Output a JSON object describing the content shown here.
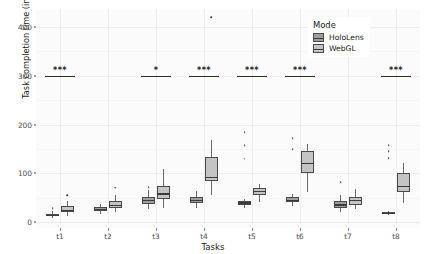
{
  "chart_data": {
    "type": "box",
    "title": "",
    "xlabel": "Tasks",
    "ylabel": "Task completion time (in seconds)",
    "categories": [
      "t1",
      "t2",
      "t3",
      "t4",
      "t5",
      "t6",
      "t7",
      "t8"
    ],
    "ylim": [
      -12,
      435
    ],
    "yticks": [
      0,
      100,
      200,
      300,
      400
    ],
    "ytick_labels": [
      "0",
      "100",
      "200",
      "300",
      "400"
    ],
    "grid": true,
    "legend": {
      "title": "Mode",
      "position": "top-right",
      "entries": [
        {
          "name": "HoloLens",
          "color": "#9e9e9e"
        },
        {
          "name": "WebGL",
          "color": "#c4c4c4"
        }
      ]
    },
    "series": [
      {
        "name": "HoloLens",
        "color": "#9e9e9e",
        "boxes": [
          {
            "category": "t1",
            "min": 8,
            "q1": 12,
            "median": 14,
            "q3": 17,
            "max": 22,
            "outliers": [
              29
            ]
          },
          {
            "category": "t2",
            "min": 16,
            "q1": 22,
            "median": 26,
            "q3": 31,
            "max": 38,
            "outliers": []
          },
          {
            "category": "t3",
            "min": 27,
            "q1": 37,
            "median": 44,
            "q3": 52,
            "max": 66,
            "outliers": [
              72
            ]
          },
          {
            "category": "t4",
            "min": 30,
            "q1": 40,
            "median": 45,
            "q3": 52,
            "max": 63,
            "outliers": []
          },
          {
            "category": "t5",
            "min": 30,
            "q1": 36,
            "median": 39,
            "q3": 43,
            "max": 48,
            "outliers": [
              130,
              158,
              185
            ]
          },
          {
            "category": "t6",
            "min": 34,
            "q1": 41,
            "median": 45,
            "q3": 51,
            "max": 58,
            "outliers": [
              150,
              172
            ]
          },
          {
            "category": "t7",
            "min": 21,
            "q1": 30,
            "median": 35,
            "q3": 44,
            "max": 55,
            "outliers": [
              82
            ]
          },
          {
            "category": "t8",
            "min": 15,
            "q1": 17,
            "median": 18,
            "q3": 20,
            "max": 23,
            "outliers": [
              131,
              146,
              158
            ]
          }
        ]
      },
      {
        "name": "WebGL",
        "color": "#c4c4c4",
        "boxes": [
          {
            "category": "t1",
            "min": 12,
            "q1": 20,
            "median": 24,
            "q3": 33,
            "max": 44,
            "outliers": [
              55
            ]
          },
          {
            "category": "t2",
            "min": 21,
            "q1": 29,
            "median": 34,
            "q3": 44,
            "max": 55,
            "outliers": [
              71
            ]
          },
          {
            "category": "t3",
            "min": 30,
            "q1": 48,
            "median": 58,
            "q3": 75,
            "max": 108,
            "outliers": []
          },
          {
            "category": "t4",
            "min": 55,
            "q1": 84,
            "median": 92,
            "q3": 133,
            "max": 168,
            "outliers": [
              420
            ]
          },
          {
            "category": "t5",
            "min": 42,
            "q1": 55,
            "median": 63,
            "q3": 71,
            "max": 78,
            "outliers": []
          },
          {
            "category": "t6",
            "min": 62,
            "q1": 100,
            "median": 120,
            "q3": 145,
            "max": 160,
            "outliers": []
          },
          {
            "category": "t7",
            "min": 26,
            "q1": 36,
            "median": 44,
            "q3": 52,
            "max": 68,
            "outliers": []
          },
          {
            "category": "t8",
            "min": 40,
            "q1": 62,
            "median": 73,
            "q3": 100,
            "max": 122,
            "outliers": []
          }
        ]
      }
    ],
    "annotations": [
      {
        "category": "t1",
        "y": 300,
        "stars": "***"
      },
      {
        "category": "t3",
        "y": 300,
        "stars": "*"
      },
      {
        "category": "t4",
        "y": 300,
        "stars": "***"
      },
      {
        "category": "t5",
        "y": 300,
        "stars": "***"
      },
      {
        "category": "t6",
        "y": 300,
        "stars": "***"
      },
      {
        "category": "t8",
        "y": 300,
        "stars": "***"
      }
    ]
  }
}
